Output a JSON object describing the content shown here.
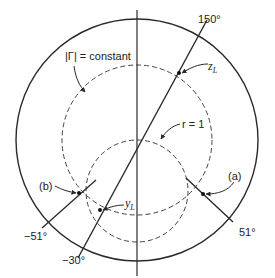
{
  "diagram": {
    "type": "smith-chart-sketch",
    "colors": {
      "line": "#2a2a2a",
      "background": "#ffffff"
    },
    "labels": {
      "gamma_constant": "|Γ| = constant",
      "r_equals_one": "r = 1",
      "z_load": "z",
      "z_load_sub": "L",
      "y_load": "y",
      "y_load_sub": "L",
      "point_a": "(a)",
      "point_b": "(b)",
      "angle_150": "150°",
      "angle_neg30": "−30°",
      "angle_51": "51°",
      "angle_neg51": "−51°"
    },
    "elements": [
      {
        "name": "unit-circle",
        "style": "solid"
      },
      {
        "name": "gamma-constant-circle",
        "style": "dashed"
      },
      {
        "name": "r-equals-1-circle",
        "style": "dashed"
      },
      {
        "name": "real-axis",
        "style": "solid"
      },
      {
        "name": "zL-yL-diameter",
        "angles": [
          "150°",
          "−30°"
        ]
      },
      {
        "name": "radial-line-a",
        "angle": "51°"
      },
      {
        "name": "radial-line-b",
        "angle": "−51°"
      }
    ]
  }
}
